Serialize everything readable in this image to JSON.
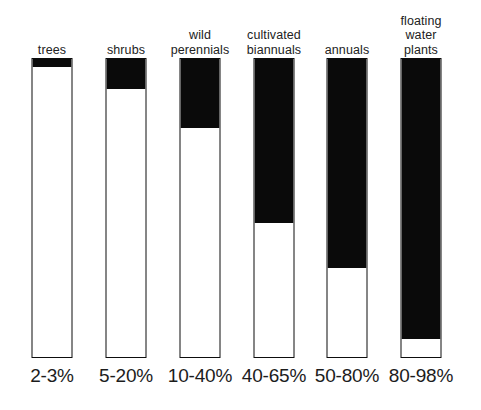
{
  "chart_data": {
    "type": "bar",
    "title": "",
    "subtitle": "",
    "xlabel": "",
    "ylabel": "",
    "ylim": [
      0,
      100
    ],
    "grid": false,
    "legend": "none",
    "orientation": "vertical",
    "categories": [
      "trees",
      "shrubs",
      "wild\nperennials",
      "cultivated\nbiannuals",
      "annuals",
      "floating\nwater\nplants"
    ],
    "value_labels": [
      "2-3%",
      "5-20%",
      "10-40%",
      "40-65%",
      "50-80%",
      "80-98%"
    ],
    "ranges": [
      {
        "min": 2,
        "max": 3
      },
      {
        "min": 5,
        "max": 20
      },
      {
        "min": 10,
        "max": 40
      },
      {
        "min": 40,
        "max": 65
      },
      {
        "min": 50,
        "max": 80
      },
      {
        "min": 80,
        "max": 98
      }
    ],
    "values": [
      2.7,
      10.0,
      23.3,
      55.0,
      70.0,
      94.0
    ],
    "fill_percent": [
      2.7,
      10.0,
      23.3,
      55.0,
      70.0,
      94.0
    ],
    "colors": {
      "fill": "#0a0a0a",
      "empty": "#ffffff",
      "outline": "#0d0d0d",
      "text": "#1c1c1c",
      "background": "#ffffff"
    }
  },
  "bars": [
    {
      "label": "trees",
      "pct_label": "2-3%",
      "fill_percent": 2.7
    },
    {
      "label": "shrubs",
      "pct_label": "5-20%",
      "fill_percent": 10.0
    },
    {
      "label": "wild\nperennials",
      "pct_label": "10-40%",
      "fill_percent": 23.3
    },
    {
      "label": "cultivated\nbiannuals",
      "pct_label": "40-65%",
      "fill_percent": 55.0
    },
    {
      "label": "annuals",
      "pct_label": "50-80%",
      "fill_percent": 70.0
    },
    {
      "label": "floating\nwater\nplants",
      "pct_label": "80-98%",
      "fill_percent": 94.0
    }
  ]
}
